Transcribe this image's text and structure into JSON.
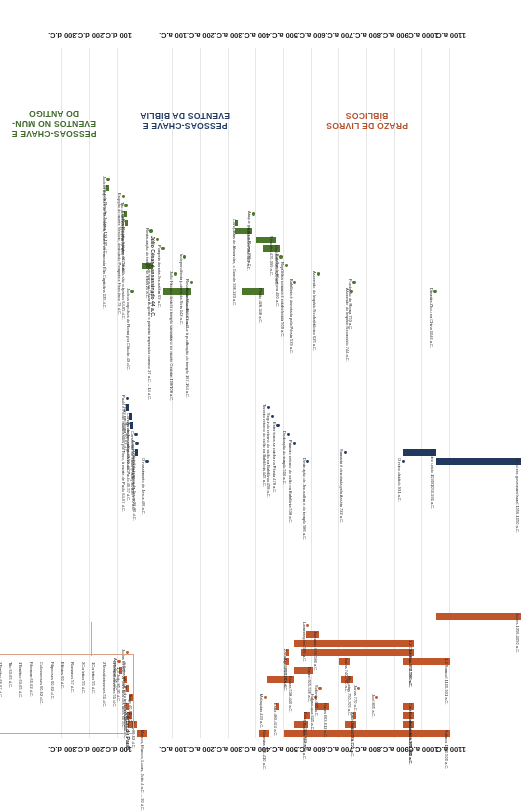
{
  "chart_data": {
    "type": "bar",
    "orientation": "horizontal-timeline",
    "xlabel": "",
    "ylabel": "",
    "axis": {
      "ticks": [
        "1100 a.C.",
        "1000 a.C.",
        "900 a.C.",
        "800 a.C.",
        "700 a.C.",
        "600 a.C.",
        "500 a.C.",
        "400 a.C.",
        "300 a.C.",
        "200 a.C.",
        "100 a.C.",
        "100 d.C.",
        "200 d.C.",
        "300 d.C."
      ],
      "tick_values": [
        -1100,
        -1000,
        -900,
        -800,
        -700,
        -600,
        -500,
        -400,
        -300,
        -200,
        -100,
        100,
        200,
        300
      ],
      "range": [
        -1150,
        330
      ],
      "grid": true,
      "legend": "none"
    },
    "bands": [
      {
        "id": "prazo-de-livros-biblicos",
        "label": "PRAZO DE LIVROS\nBÍBLICOS",
        "color": "#c1562a",
        "series": [
          {
            "label": "Salmos 1100-500 a.C.",
            "start": -1100,
            "end": -500,
            "type": "bar"
          },
          {
            "label": "Provérbios 971-931 a.C.",
            "start": -971,
            "end": -931,
            "type": "bar"
          },
          {
            "label": "Eclesiastes 971-931 a.C.",
            "start": -971,
            "end": -931,
            "type": "bar"
          },
          {
            "label": "Cântico dos Cânticos 971-931 a.C.",
            "start": -971,
            "end": -931,
            "type": "bar"
          },
          {
            "label": "Joel 835 a.C.",
            "start": -835,
            "end": -835,
            "type": "dot"
          },
          {
            "label": "Oseias 760-722 a.C.",
            "start": -760,
            "end": -722,
            "type": "bar"
          },
          {
            "label": "Amós 760-750 a.C.",
            "start": -760,
            "end": -750,
            "type": "bar"
          },
          {
            "label": "Jonas 770 a.C.",
            "start": -770,
            "end": -770,
            "type": "dot"
          },
          {
            "label": "Miqueias 750-705 a.C.",
            "start": -750,
            "end": -705,
            "type": "bar"
          },
          {
            "label": "Naum 663-612 a.C.",
            "start": -663,
            "end": -612,
            "type": "bar"
          },
          {
            "label": "Habacuque 615 a.C.",
            "start": -615,
            "end": -615,
            "type": "dot"
          },
          {
            "label": "Sofonias 630 a.C.",
            "start": -630,
            "end": -630,
            "type": "dot"
          },
          {
            "label": "Ezequiel 593-573 a.C.",
            "start": -593,
            "end": -573,
            "type": "bar"
          },
          {
            "label": "Daniel 605-536 a.C.",
            "start": -605,
            "end": -536,
            "type": "bar"
          },
          {
            "label": "Obadias 586-538 a.C.",
            "start": -586,
            "end": -538,
            "type": "bar"
          },
          {
            "label": "Esdras 538-440 a.C.",
            "start": -538,
            "end": -440,
            "type": "bar"
          },
          {
            "label": "Neemias 445-410 a.C.",
            "start": -445,
            "end": -410,
            "type": "bar"
          },
          {
            "label": "Ester 483-474 a.C.",
            "start": -483,
            "end": -474,
            "type": "bar"
          },
          {
            "label": "1-2 Samuel 1100-931 a.C.",
            "start": -1100,
            "end": -931,
            "type": "bar"
          },
          {
            "label": "1-2 Reis 971-560 a.C.",
            "start": -971,
            "end": -560,
            "type": "bar"
          },
          {
            "label": "1-2 Crônicas 971-538 a.C.",
            "start": -971,
            "end": -538,
            "type": "bar"
          },
          {
            "label": "Isaías 740-700 a.C.",
            "start": -740,
            "end": -700,
            "type": "bar"
          },
          {
            "label": "Jeremias 626-580 a.C.",
            "start": -626,
            "end": -580,
            "type": "bar"
          },
          {
            "label": "Lamentações 586 a.C.",
            "start": -586,
            "end": -586,
            "type": "dot"
          },
          {
            "label": "Ageu 520-516 a.C.",
            "start": -520,
            "end": -516,
            "type": "bar"
          },
          {
            "label": "Zacarias 520-516 a.C.",
            "start": -520,
            "end": -516,
            "type": "bar"
          },
          {
            "label": "Malaquias 433 a.C.",
            "start": -433,
            "end": -433,
            "type": "dot"
          },
          {
            "label": "Juízes 1356-1050 a.C.",
            "start": -1356,
            "end": -1050,
            "type": "bar"
          },
          {
            "label": "Mateus, Marcos, Lucas, João 4 a.C. – 30 d.C.",
            "start": -4,
            "end": 30,
            "type": "bar"
          },
          {
            "label": "Atos 30-62 d.C.",
            "start": 30,
            "end": 62,
            "type": "bar"
          },
          {
            "label": "Cartas de Paulo",
            "start": 49,
            "end": 67,
            "type": "bar",
            "bold": true
          },
          {
            "label": "Hebreus 60 d.C.",
            "start": 60,
            "end": 60,
            "type": "bar"
          },
          {
            "label": "Tiago 40-60 d.C.",
            "start": 40,
            "end": 60,
            "type": "bar"
          },
          {
            "label": "1Pedro início dos anos 60 d.C.",
            "start": 60,
            "end": 64,
            "type": "bar"
          },
          {
            "label": "2Pedro final dos anos 60 d.C.",
            "start": 65,
            "end": 68,
            "type": "bar"
          },
          {
            "label": "1-3 João 85-95 d.C.",
            "start": 85,
            "end": 95,
            "type": "bar"
          },
          {
            "label": "Apocalipse 95 d.C.",
            "start": 95,
            "end": 95,
            "type": "dot"
          },
          {
            "label": "Judas 65 d.C.",
            "start": 65,
            "end": 65,
            "type": "dot"
          }
        ],
        "callout": {
          "title": "Cartas de Paulo",
          "items": [
            "Gálatas 49 d.C.",
            "1Tessalonicenses 51 d.C.",
            "2Tessalonicenses 51 d.C.",
            "1Coríntios 55 d.C.",
            "2Coríntios 55 d.C.",
            "Romanos 57 d.C.",
            "Efésios 60 d.C.",
            "Filipenses 60-62 d.C.",
            "Colossenses 60-62 d.C.",
            "Filemom 60-62 d.C.",
            "1Timóteo 63-65 d.C.",
            "Tito 63-65 d.C.",
            "2Timóteo 66-67 d.C."
          ]
        }
      },
      {
        "id": "pessoas-chave-e-eventos-da-biblia",
        "label": "PESSOAS-CHAVE E\nEVENTOS DA BÍBLIA",
        "color": "#21395f",
        "series": [
          {
            "label": "Os juízes governam Israel 1356-1050 a.C.",
            "start": -1356,
            "end": -1050,
            "type": "bar"
          },
          {
            "label": "O reino unido 1030/1050-931 a.C.",
            "start": -1050,
            "end": -931,
            "type": "bar"
          },
          {
            "label": "O reino dividido 931 a.C.",
            "start": -931,
            "end": -931,
            "type": "dot"
          },
          {
            "label": "Samaria é derrotada pela Assíria 722 a.C.",
            "start": -722,
            "end": -722,
            "type": "dot"
          },
          {
            "label": "Destruição de Jerusalém e do templo 586 a.C.",
            "start": -586,
            "end": -586,
            "type": "dot"
          },
          {
            "label": "Primeiro retorno do exílio na Babilônia 538 a.C.",
            "start": -538,
            "end": -538,
            "type": "dot"
          },
          {
            "label": "Dedicação do templo 516 a.C.",
            "start": -516,
            "end": -516,
            "type": "dot"
          },
          {
            "label": "Ester torna-se rainha na Pérsia 478 a.C.",
            "start": -478,
            "end": -478,
            "type": "dot"
          },
          {
            "label": "Segundo retorno do exílio na Babilônia 458 a.C.",
            "start": -458,
            "end": -458,
            "type": "dot"
          },
          {
            "label": "Terceiro retorno do exílio na Babilônia 445 a.C.",
            "start": -445,
            "end": -445,
            "type": "dot"
          },
          {
            "label": "O nascimento de Jesus 4/6 a.C.",
            "start": -5,
            "end": -5,
            "type": "dot"
          },
          {
            "label": "O ministério terreno de Jesus 26-30 d.C.",
            "start": 26,
            "end": 30,
            "type": "bar"
          },
          {
            "label": "A morte e ressurreição de Jesus 30 d.C.",
            "start": 30,
            "end": 30,
            "type": "dot"
          },
          {
            "label": "Conversão de Saulo (Paulo) 34 d.C.",
            "start": 34,
            "end": 34,
            "type": "dot"
          },
          {
            "label": "As viagens missionárias de Paulo 46-57 d.C.",
            "start": 46,
            "end": 57,
            "type": "bar"
          },
          {
            "label": "Concílio de Jerusalém 49-50 d.C.",
            "start": 49,
            "end": 50,
            "type": "bar"
          },
          {
            "label": "Pedro em Roma 60-63 d.C.",
            "start": 60,
            "end": 63,
            "type": "bar"
          },
          {
            "label": "Paulo e Pedro martirizados por Nero, à morte de Paulo 64-67 d.C.",
            "start": 64,
            "end": 67,
            "type": "dot"
          }
        ]
      },
      {
        "id": "pessoas-chave-e-eventos-no-mundo-antigo",
        "label": "PESSOAS-CHAVE E\nEVENTOS NO MUN-\nDO ANTIGO",
        "color": "#4a7729",
        "series": [
          {
            "label": "Dinastia Zhou na China 1046 a.C.",
            "start": -1046,
            "end": -1046,
            "type": "dot"
          },
          {
            "label": "Ascensão do Império Neoassírio 744 a.C.",
            "start": -744,
            "end": -744,
            "type": "dot"
          },
          {
            "label": "Fundação de Roma 753 a.C.",
            "start": -753,
            "end": -753,
            "type": "dot"
          },
          {
            "label": "Ascensão do Império Neobabilônico 625 a.C.",
            "start": -625,
            "end": -625,
            "type": "dot"
          },
          {
            "label": "Babilônia é derrotada pela Pérsia 539 a.C.",
            "start": -539,
            "end": -539,
            "type": "dot"
          },
          {
            "label": "República romana é estabelecida 509 a.C.",
            "start": -509,
            "end": -509,
            "type": "dot"
          },
          {
            "label": "Batalha de Maratona 490 a.C.",
            "start": -490,
            "end": -490,
            "type": "dot"
          },
          {
            "label": "Heródoto 485-425 a.C.",
            "start": -485,
            "end": -425,
            "type": "bar"
          },
          {
            "label": "Sócrates 470-399 a.C.",
            "start": -470,
            "end": -399,
            "type": "bar"
          },
          {
            "label": "Platão 428-348 a.C.",
            "start": -428,
            "end": -348,
            "type": "bar"
          },
          {
            "label": "Aristóteles 384-322 a.C.",
            "start": -384,
            "end": -322,
            "type": "bar"
          },
          {
            "label": "Conquistas de Alexandre, o Grande 336-323 a.C.",
            "start": -336,
            "end": -323,
            "type": "bar"
          },
          {
            "label": "Ataque gaulês a Roma 390 a.C.",
            "start": -390,
            "end": -390,
            "type": "dot"
          },
          {
            "label": "Asmoneus 164-63 a.C.",
            "start": -164,
            "end": -63,
            "type": "bar"
          },
          {
            "label": "Revolta de Macabeus conduz à purificação do templo 167-164 a.C.",
            "start": -167,
            "end": -164,
            "type": "dot"
          },
          {
            "label": "João Hircano destrói o templo samaritano no monte Gerizim 108/108 a.C.",
            "start": -108,
            "end": -108,
            "type": "dot"
          },
          {
            "label": "Otávio torna-se César Augusto e primeiro imperador romano 27 a.C. – 14 d.C.",
            "start": -27,
            "end": 14,
            "type": "bar"
          },
          {
            "label": "Independência judaica da Síria 142 a.C.",
            "start": -142,
            "end": -142,
            "type": "dot"
          },
          {
            "label": "Pompeia derrota Jerusalém 63 a.C.",
            "start": -63,
            "end": -63,
            "type": "dot"
          },
          {
            "label": "Júlio César é assassinado 44 a.C.",
            "start": -44,
            "end": -44,
            "type": "dot",
            "bold": true
          },
          {
            "label": "Restauração do templo se inicia 20 a.C.",
            "start": -20,
            "end": -20,
            "type": "dot"
          },
          {
            "label": "Judeus expulsos de Roma por Cláudio 49 d.C.",
            "start": 49,
            "end": 49,
            "type": "dot"
          },
          {
            "label": "Roma é incendiada, os Cristãos são culpados 64-65 d.C.",
            "start": 64,
            "end": 65,
            "type": "bar"
          },
          {
            "label": "Primeira Revolta Judaica 66-73 d.C.",
            "start": 66,
            "end": 73,
            "type": "bar"
          },
          {
            "label": "Tito destrói Jerusalém 70 d.C.",
            "start": 70,
            "end": 70,
            "type": "dot"
          },
          {
            "label": "Erupção do monte Vesúvio, destruindo Pompeia e Herculano 79 d.C.",
            "start": 79,
            "end": 79,
            "type": "dot"
          },
          {
            "label": "Segunda Revolta Judaica 132-135 d.C.",
            "start": 132,
            "end": 135,
            "type": "bar"
          },
          {
            "label": "Judeus expulsos de Jerusalém, cidade renomeada Élia Capitolina 135 d.C.",
            "start": 135,
            "end": 135,
            "type": "dot"
          }
        ]
      }
    ]
  }
}
